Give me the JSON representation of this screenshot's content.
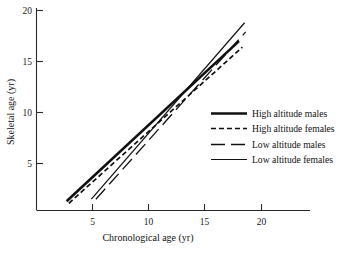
{
  "chart_data": {
    "type": "line",
    "title": "",
    "xlabel": "Chronological age (yr)",
    "ylabel": "Skeletal age (yr)",
    "xlim": [
      1.5,
      24
    ],
    "ylim": [
      0.4,
      20.8
    ],
    "xticks": [
      5,
      10,
      15,
      20
    ],
    "yticks": [
      5,
      10,
      15,
      20
    ],
    "xticklabels": [
      "5",
      "10",
      "15",
      "20"
    ],
    "yticklabels": [
      "5",
      "10",
      "15",
      "20"
    ],
    "grid": false,
    "legend_position": "center-right",
    "series": [
      {
        "name": "High altitude males",
        "style": "solid-thick",
        "x": [
          2.7,
          18.0
        ],
        "y": [
          1.3,
          17.0
        ]
      },
      {
        "name": "High altitude females",
        "style": "dashed",
        "x": [
          2.9,
          18.3
        ],
        "y": [
          1.1,
          16.4
        ]
      },
      {
        "name": "Low altitude males",
        "style": "long-dash",
        "x": [
          5.3,
          18.6
        ],
        "y": [
          1.5,
          17.9
        ]
      },
      {
        "name": "Low altitude females",
        "style": "solid-thin",
        "x": [
          4.9,
          18.5
        ],
        "y": [
          1.5,
          18.8
        ]
      }
    ],
    "crossing_point": {
      "x": 13.0,
      "y": 12.0
    }
  },
  "legend": {
    "items": [
      {
        "label": "High altitude males",
        "style": "solid-thick"
      },
      {
        "label": "High altitude females",
        "style": "dashed"
      },
      {
        "label": "Low altitude males",
        "style": "long-dash"
      },
      {
        "label": "Low altitude females",
        "style": "solid-thin"
      }
    ]
  },
  "colors": {
    "line": "#111111",
    "axis": "#2b2b2b",
    "background": "#ffffff"
  }
}
